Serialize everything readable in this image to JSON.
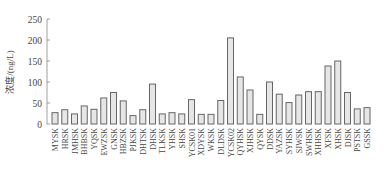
{
  "chart_data": {
    "type": "bar",
    "title": "",
    "xlabel": "",
    "ylabel": "浓度/(ng/L)",
    "ylim": [
      0,
      250
    ],
    "yticks": [
      0,
      50,
      100,
      150,
      200,
      250
    ],
    "grid": false,
    "legend": null,
    "categories": [
      "MYSK",
      "HRSK",
      "JMHSK",
      "BHBSK",
      "YQSK",
      "EWZSK",
      "GNSK",
      "HBZSK",
      "PJKSK",
      "DHTSK",
      "DHSK",
      "TLKSK",
      "YHSK",
      "SHSK",
      "YCSK01",
      "XDYSK",
      "WKSK",
      "DLDSK",
      "YCSK02",
      "QYHSK",
      "XJHSK",
      "QYSK",
      "DDSK",
      "YAZSK",
      "SYHSK",
      "SJWSK",
      "SWHSK",
      "XHHSK",
      "XFSK",
      "XHSK",
      "DJSK",
      "PSTSK",
      "GSSK"
    ],
    "values": [
      27,
      34,
      24,
      43,
      35,
      62,
      75,
      55,
      20,
      34,
      95,
      24,
      27,
      24,
      58,
      23,
      23,
      56,
      205,
      112,
      81,
      23,
      100,
      71,
      51,
      69,
      77,
      77,
      138,
      150,
      75,
      36,
      39
    ]
  },
  "colors": {
    "bar_fill": "#e6e6e6",
    "bar_stroke": "#666666",
    "axis": "#888888"
  }
}
